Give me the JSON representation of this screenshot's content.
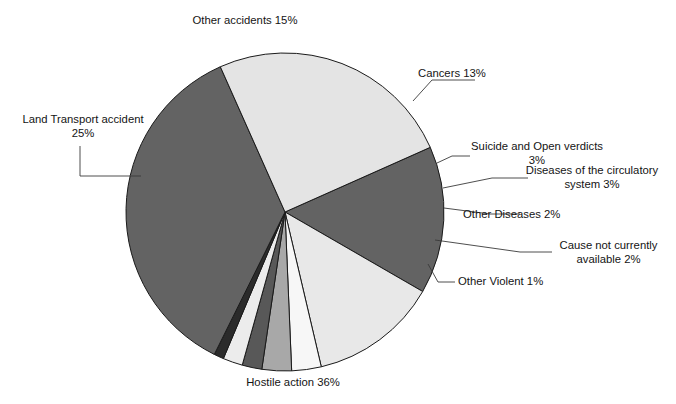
{
  "chart": {
    "title": "",
    "title_clipped": true
  },
  "chart_data": {
    "type": "pie",
    "title": "",
    "xlabel": "",
    "ylabel": "",
    "legend_position": "none",
    "grid": false,
    "labels_show_percent": true,
    "start_angle_deg": -24,
    "direction": "clockwise",
    "center": {
      "x": 285,
      "y": 212
    },
    "radius": 159,
    "categories": [
      "Other accidents",
      "Cancers",
      "Suicide and Open verdicts",
      "Diseases of the circulatory system",
      "Other Diseases",
      "Cause not currently available",
      "Other Violent",
      "Hostile action",
      "Land Transport accident"
    ],
    "values": [
      15,
      13,
      3,
      3,
      2,
      2,
      1,
      36,
      25
    ],
    "unit": "%",
    "colors": [
      "#636363",
      "#e8e8e8",
      "#f7f7f7",
      "#a8a8a8",
      "#585858",
      "#ececec",
      "#2b2b2b",
      "#636363",
      "#e4e4e4"
    ],
    "slice_border_color": "#1a1a1a",
    "slices": [
      {
        "name": "Other accidents",
        "percent": 15,
        "label": "Other accidents 15%"
      },
      {
        "name": "Cancers",
        "percent": 13,
        "label": "Cancers 13%"
      },
      {
        "name": "Suicide and Open verdicts",
        "percent": 3,
        "label": "Suicide and Open verdicts\n3%"
      },
      {
        "name": "Diseases of the circulatory system",
        "percent": 3,
        "label": "Diseases of the circulatory\nsystem 3%"
      },
      {
        "name": "Other Diseases",
        "percent": 2,
        "label": "Other Diseases 2%"
      },
      {
        "name": "Cause not currently available",
        "percent": 2,
        "label": "Cause not currently\navailable 2%"
      },
      {
        "name": "Other Violent",
        "percent": 1,
        "label": "Other Violent 1%"
      },
      {
        "name": "Hostile action",
        "percent": 36,
        "label": "Hostile action 36%"
      },
      {
        "name": "Land Transport accident",
        "percent": 25,
        "label": "Land Transport accident\n25%"
      }
    ]
  },
  "labels": {
    "other_accidents": "Other accidents 15%",
    "cancers": "Cancers 13%",
    "suicide_open_verdicts": "Suicide and Open verdicts\n3%",
    "circulatory": "Diseases of the circulatory\nsystem 3%",
    "other_diseases": "Other Diseases 2%",
    "cause_not_available": "Cause not currently\navailable 2%",
    "other_violent": "Other Violent 1%",
    "hostile_action": "Hostile action 36%",
    "land_transport": "Land Transport accident\n25%"
  }
}
